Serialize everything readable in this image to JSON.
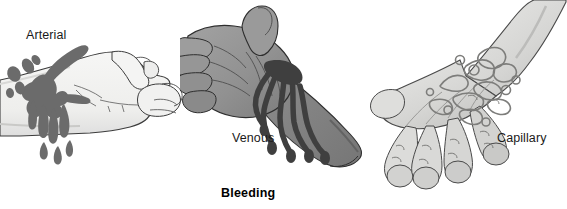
{
  "figure": {
    "title": "Bleeding",
    "background_color": "#ffffff",
    "width": 567,
    "height": 209,
    "style": "grayscale medical line illustration"
  },
  "panels": [
    {
      "id": "arterial",
      "label": "Arterial",
      "subject": "hand-and-forearm-side-view",
      "wound_location": "wrist",
      "blood_pattern": "spurting-jets-with-flying-droplets",
      "skin_fill": "#f2f2f0",
      "skin_shadow": "#d8d8d6",
      "blood_color": "#6e6e6e",
      "outline_color": "#3a3a3a"
    },
    {
      "id": "venous",
      "label": "Venous",
      "subject": "hand-and-forearm-palm-up",
      "wound_location": "wrist",
      "blood_pattern": "steady-flowing-streams",
      "skin_fill": "#969696",
      "skin_shadow": "#7d7d7d",
      "blood_color": "#4a4a4a",
      "outline_color": "#2e2e2e"
    },
    {
      "id": "capillary",
      "label": "Capillary",
      "subject": "hand-back-view",
      "wound_location": "back-of-hand",
      "blood_pattern": "scraped-abrasion-oozing-patch",
      "skin_fill": "#dcdcda",
      "skin_shadow": "#c2c2c0",
      "blood_color": "#8a8a8a",
      "outline_color": "#4a4a4a"
    }
  ]
}
